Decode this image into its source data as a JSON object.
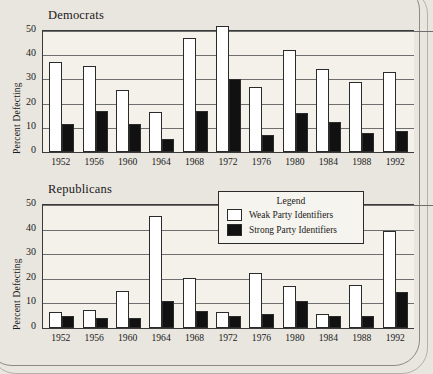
{
  "legend": {
    "title": "Legend",
    "entries": [
      {
        "label": "Weak Party Identifiers",
        "swatch": "white"
      },
      {
        "label": "Strong Party Identifiers",
        "swatch": "black"
      }
    ]
  },
  "chart_data": [
    {
      "type": "bar",
      "title": "Democrats",
      "xlabel": "",
      "ylabel": "Percent Defecting",
      "ylim": [
        0,
        50
      ],
      "yticks": [
        0,
        10,
        20,
        30,
        40,
        50
      ],
      "grid": true,
      "legend_position": "none",
      "categories": [
        "1952",
        "1956",
        "1960",
        "1964",
        "1968",
        "1972",
        "1976",
        "1980",
        "1984",
        "1988",
        "1992"
      ],
      "series": [
        {
          "name": "Weak Party Identifiers",
          "color": "#ffffff",
          "values": [
            37,
            35.5,
            25.5,
            16.5,
            47,
            52,
            27,
            42,
            34.5,
            29,
            33
          ]
        },
        {
          "name": "Strong Party Identifiers",
          "color": "#111111",
          "values": [
            11.5,
            17,
            11.5,
            5.5,
            17,
            30,
            7,
            16,
            12.5,
            8,
            8.5
          ]
        }
      ]
    },
    {
      "type": "bar",
      "title": "Republicans",
      "xlabel": "",
      "ylabel": "Percent Defecting",
      "ylim": [
        0,
        50
      ],
      "yticks": [
        0,
        10,
        20,
        30,
        40,
        50
      ],
      "grid": true,
      "legend_position": "inside-top-right",
      "categories": [
        "1952",
        "1956",
        "1960",
        "1964",
        "1968",
        "1972",
        "1976",
        "1980",
        "1984",
        "1988",
        "1992"
      ],
      "series": [
        {
          "name": "Weak Party Identifiers",
          "color": "#ffffff",
          "values": [
            6.5,
            7.5,
            15,
            45.5,
            20.5,
            6.5,
            22.5,
            17,
            5.5,
            17.5,
            39.5
          ]
        },
        {
          "name": "Strong Party Identifiers",
          "color": "#111111",
          "values": [
            5,
            4,
            4,
            11,
            7,
            5,
            5.5,
            11,
            5,
            5,
            14.5
          ]
        }
      ]
    }
  ]
}
